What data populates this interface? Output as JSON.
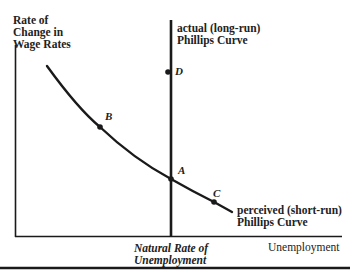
{
  "diagram": {
    "y_axis_label": [
      "Rate of",
      "Change in",
      "Wage Rates"
    ],
    "x_axis_label": "Unemployment",
    "x_tick_label": [
      "Natural Rate of",
      "Unemployment"
    ],
    "long_run_curve_label": [
      "actual (long-run)",
      "Phillips Curve"
    ],
    "short_run_curve_label": [
      "perceived (short-run)",
      "Phillips Curve"
    ],
    "points": {
      "A": "A",
      "B": "B",
      "C": "C",
      "D": "D"
    },
    "colors": {
      "ink": "#1a1a1a",
      "background": "#ffffff"
    }
  }
}
